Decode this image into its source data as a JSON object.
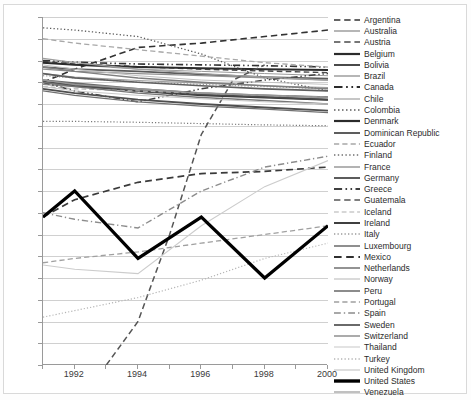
{
  "chart_data": {
    "type": "line",
    "title": "",
    "xlabel": "",
    "ylabel": "",
    "xlim": [
      1991,
      2000
    ],
    "ylim": [
      15,
      95
    ],
    "ytick_labels": [
      "95",
      "90",
      "85",
      "80",
      "75",
      "70",
      "65",
      "60",
      "55",
      "50",
      "45",
      "40",
      "35",
      "30",
      "25",
      "20",
      "15"
    ],
    "ytick_values": [
      95,
      90,
      85,
      80,
      75,
      70,
      65,
      60,
      55,
      50,
      45,
      40,
      35,
      30,
      25,
      20,
      15
    ],
    "xtick_labels": [
      "1992",
      "1994",
      "1996",
      "1998",
      "2000"
    ],
    "xtick_values": [
      1992,
      1994,
      1996,
      1998,
      2000
    ],
    "xminor_values": [
      1991,
      1993,
      1995,
      1997,
      1999
    ],
    "grid": "horizontal",
    "legend_position": "right",
    "x": [
      1991,
      1992,
      1993,
      1994,
      1995,
      1996,
      1997,
      1998,
      1999,
      2000
    ],
    "series": [
      {
        "name": "Argentina",
        "style": "dashed",
        "width": 1.6,
        "color": "#333333",
        "x": [
          1991,
          1992,
          1994,
          1996,
          1998,
          2000
        ],
        "values": [
          80.0,
          83.0,
          88.0,
          89.0,
          90.5,
          92.0
        ]
      },
      {
        "name": "Australia",
        "style": "solid",
        "width": 1.0,
        "color": "#9a9a9a",
        "x": [
          1991,
          1992,
          1994,
          1996,
          1998,
          2000
        ],
        "values": [
          84.5,
          84.0,
          83.0,
          82.5,
          82.0,
          81.5
        ]
      },
      {
        "name": "Austria",
        "style": "dashed",
        "width": 1.4,
        "color": "#4a4a4a",
        "x": [
          1991,
          1992,
          1994,
          1996,
          1998,
          2000
        ],
        "values": [
          84.8,
          84.2,
          83.6,
          83.0,
          82.6,
          82.2
        ]
      },
      {
        "name": "Belgium",
        "style": "solid",
        "width": 2.0,
        "color": "#2b2b2b",
        "x": [
          1991,
          1992,
          1994,
          1996,
          1998,
          2000
        ],
        "values": [
          84.5,
          84.0,
          83.5,
          83.2,
          83.0,
          82.8
        ]
      },
      {
        "name": "Bolivia",
        "style": "solid",
        "width": 1.8,
        "color": "#5a5a5a",
        "x": [
          1991,
          1992,
          1994,
          1996,
          1998,
          2000
        ],
        "values": [
          83.5,
          83.0,
          82.5,
          81.8,
          81.2,
          80.8
        ]
      },
      {
        "name": "Brazil",
        "style": "solid",
        "width": 1.2,
        "color": "#8f8f8f",
        "x": [
          1991,
          1992,
          1994,
          1996,
          1998,
          2000
        ],
        "values": [
          83.0,
          82.5,
          82.0,
          81.5,
          81.0,
          80.5
        ]
      },
      {
        "name": "Canada",
        "style": "dashdotdot",
        "width": 1.6,
        "color": "#333333",
        "x": [
          1991,
          1992,
          1994,
          1996,
          1998,
          2000
        ],
        "values": [
          85.0,
          84.6,
          84.2,
          84.0,
          83.8,
          83.5
        ]
      },
      {
        "name": "Chile",
        "style": "solid",
        "width": 1.1,
        "color": "#9f9f9f",
        "x": [
          1991,
          1992,
          1994,
          1996,
          1998,
          2000
        ],
        "values": [
          82.0,
          81.2,
          80.4,
          79.8,
          79.2,
          78.8
        ]
      },
      {
        "name": "Colombia",
        "style": "dotted",
        "width": 1.3,
        "color": "#5c5c5c",
        "x": [
          1991,
          1992,
          1994,
          1996,
          1998,
          2000
        ],
        "values": [
          92.5,
          92.0,
          90.5,
          86.5,
          81.0,
          78.0
        ]
      },
      {
        "name": "Denmark",
        "style": "solid",
        "width": 2.0,
        "color": "#3a3a3a",
        "x": [
          1991,
          1992,
          1994,
          1996,
          1998,
          2000
        ],
        "values": [
          80.0,
          79.5,
          78.0,
          77.0,
          76.5,
          76.0
        ]
      },
      {
        "name": "Dominican Republic",
        "style": "solid",
        "width": 1.8,
        "color": "#6a6a6a",
        "x": [
          1991,
          1992,
          1994,
          1996,
          1998,
          2000
        ],
        "values": [
          80.5,
          79.8,
          78.5,
          77.5,
          77.0,
          76.6
        ]
      },
      {
        "name": "Ecuador",
        "style": "dashed",
        "width": 1.3,
        "color": "#a8a8a8",
        "x": [
          1991,
          1992,
          1994,
          1996,
          1998,
          2000
        ],
        "values": [
          90.0,
          89.0,
          87.5,
          86.0,
          84.5,
          83.5
        ]
      },
      {
        "name": "Finland",
        "style": "dotted",
        "width": 1.2,
        "color": "#7a7a7a",
        "x": [
          1991,
          1992,
          1994,
          1996,
          1998,
          2000
        ],
        "values": [
          71.0,
          71.0,
          70.8,
          70.5,
          70.2,
          70.0
        ]
      },
      {
        "name": "France",
        "style": "solid",
        "width": 1.2,
        "color": "#8a8a8a",
        "x": [
          1991,
          1992,
          1994,
          1996,
          1998,
          2000
        ],
        "values": [
          79.5,
          79.0,
          78.2,
          77.5,
          77.0,
          76.5
        ]
      },
      {
        "name": "Germany",
        "style": "solid",
        "width": 1.6,
        "color": "#4a4a4a",
        "x": [
          1991,
          1992,
          1994,
          1996,
          1998,
          2000
        ],
        "values": [
          80.0,
          79.2,
          78.0,
          77.2,
          76.6,
          76.0
        ]
      },
      {
        "name": "Greece",
        "style": "dashdotdot",
        "width": 1.5,
        "color": "#3f3f3f",
        "x": [
          1991,
          1992,
          1994,
          1996,
          1998,
          2000
        ],
        "values": [
          80.0,
          78.0,
          75.5,
          78.5,
          80.5,
          82.0
        ]
      },
      {
        "name": "Guatemala",
        "style": "dashed",
        "width": 1.5,
        "color": "#555555",
        "x": [
          1993,
          1994,
          1995,
          1996,
          1997,
          1998
        ],
        "values": [
          15.0,
          25.0,
          45.0,
          68.0,
          80.5,
          84.0
        ]
      },
      {
        "name": "Iceland",
        "style": "dashed",
        "width": 1.2,
        "color": "#b0b0b0",
        "x": [
          1991,
          1992,
          1994,
          1996,
          1998,
          2000
        ],
        "values": [
          79.0,
          78.5,
          78.0,
          77.5,
          77.0,
          76.5
        ]
      },
      {
        "name": "Ireland",
        "style": "solid",
        "width": 1.8,
        "color": "#4f4f4f",
        "x": [
          1991,
          1992,
          1994,
          1996,
          1998,
          2000
        ],
        "values": [
          78.5,
          77.5,
          76.0,
          75.0,
          74.2,
          73.5
        ]
      },
      {
        "name": "Italy",
        "style": "dotted",
        "width": 1.2,
        "color": "#9a9a9a",
        "x": [
          1991,
          1992,
          1994,
          1996,
          1998,
          2000
        ],
        "values": [
          81.5,
          81.0,
          80.0,
          79.5,
          79.0,
          78.5
        ]
      },
      {
        "name": "Luxembourg",
        "style": "solid",
        "width": 1.3,
        "color": "#707070",
        "x": [
          1991,
          1992,
          1994,
          1996,
          1998,
          2000
        ],
        "values": [
          78.0,
          77.0,
          75.5,
          74.5,
          73.8,
          73.0
        ]
      },
      {
        "name": "Mexico",
        "style": "dashed",
        "width": 1.7,
        "color": "#3a3a3a",
        "x": [
          1991,
          1992,
          1994,
          1996,
          1998,
          2000
        ],
        "values": [
          49.0,
          53.0,
          57.0,
          59.0,
          59.5,
          60.5
        ]
      },
      {
        "name": "Netherlands",
        "style": "solid",
        "width": 1.4,
        "color": "#757575",
        "x": [
          1991,
          1992,
          1994,
          1996,
          1998,
          2000
        ],
        "values": [
          80.0,
          79.0,
          77.5,
          76.5,
          75.8,
          75.0
        ]
      },
      {
        "name": "Norway",
        "style": "solid",
        "width": 1.0,
        "color": "#c0c0c0",
        "x": [
          1991,
          1992,
          1994,
          1996,
          1998,
          2000
        ],
        "values": [
          84.0,
          83.0,
          81.5,
          80.5,
          80.0,
          79.5
        ]
      },
      {
        "name": "Peru",
        "style": "solid",
        "width": 1.5,
        "color": "#7f7f7f",
        "x": [
          1991,
          1992,
          1994,
          1996,
          1998,
          2000
        ],
        "values": [
          83.5,
          82.5,
          81.0,
          80.0,
          79.2,
          78.5
        ]
      },
      {
        "name": "Portugal",
        "style": "dashed",
        "width": 1.3,
        "color": "#a0a0a0",
        "x": [
          1991,
          1992,
          1994,
          1996,
          1998,
          2000
        ],
        "values": [
          38.5,
          39.5,
          41.0,
          43.0,
          45.0,
          47.0
        ]
      },
      {
        "name": "Spain",
        "style": "dashdot",
        "width": 1.4,
        "color": "#8c8c8c",
        "x": [
          1991,
          1992,
          1994,
          1996,
          1998,
          2000
        ],
        "values": [
          50.0,
          48.5,
          46.5,
          55.0,
          60.5,
          63.0
        ]
      },
      {
        "name": "Sweden",
        "style": "solid",
        "width": 1.7,
        "color": "#5f5f5f",
        "x": [
          1991,
          1992,
          1994,
          1996,
          1998,
          2000
        ],
        "values": [
          82.0,
          81.0,
          80.0,
          79.2,
          78.5,
          78.0
        ]
      },
      {
        "name": "Switzerland",
        "style": "solid",
        "width": 1.5,
        "color": "#959595",
        "x": [
          1991,
          1992,
          1994,
          1996,
          1998,
          2000
        ],
        "values": [
          80.5,
          79.5,
          78.5,
          77.5,
          77.0,
          76.5
        ]
      },
      {
        "name": "Thailand",
        "style": "solid",
        "width": 1.1,
        "color": "#cccccc",
        "x": [
          1991,
          1992,
          1994,
          1996,
          1998,
          2000
        ],
        "values": [
          38.0,
          37.0,
          36.0,
          47.0,
          56.0,
          62.0
        ]
      },
      {
        "name": "Turkey",
        "style": "dotted",
        "width": 1.2,
        "color": "#b5b5b5",
        "x": [
          1991,
          1992,
          1994,
          1996,
          1998,
          2000
        ],
        "values": [
          26.0,
          27.5,
          30.5,
          34.5,
          39.5,
          43.0
        ]
      },
      {
        "name": "United Kingdom",
        "style": "solid",
        "width": 1.0,
        "color": "#c8c8c8",
        "x": [
          1991,
          1992,
          1994,
          1996,
          1998,
          2000
        ],
        "values": [
          79.0,
          78.0,
          77.0,
          76.2,
          75.5,
          75.0
        ]
      },
      {
        "name": "United States",
        "style": "solid",
        "width": 3.2,
        "color": "#000000",
        "x": [
          1991,
          1992,
          1994,
          1996,
          1998,
          2000
        ],
        "values": [
          49.0,
          55.0,
          39.5,
          49.0,
          35.0,
          47.0
        ]
      },
      {
        "name": "Venezuela",
        "style": "solid",
        "width": 1.2,
        "color": "#9e9e9e",
        "x": [
          1991,
          1992,
          1994,
          1996,
          1998,
          2000
        ],
        "values": [
          85.5,
          84.5,
          83.0,
          82.0,
          81.2,
          80.5
        ]
      }
    ],
    "legend_entries": [
      {
        "label": "Argentina",
        "style": "dashed",
        "width": 1.6,
        "color": "#333333"
      },
      {
        "label": "Australia",
        "style": "solid",
        "width": 1.3,
        "color": "#8f8f8f"
      },
      {
        "label": "Austria",
        "style": "dashed",
        "width": 1.6,
        "color": "#4a4a4a"
      },
      {
        "label": "Belgium",
        "style": "solid",
        "width": 2.2,
        "color": "#2b2b2b"
      },
      {
        "label": "Bolivia",
        "style": "solid",
        "width": 2.0,
        "color": "#4a4a4a"
      },
      {
        "label": "Brazil",
        "style": "solid",
        "width": 1.3,
        "color": "#8f8f8f"
      },
      {
        "label": "Canada",
        "style": "dashdotdot",
        "width": 1.9,
        "color": "#2b2b2b"
      },
      {
        "label": "Chile",
        "style": "solid",
        "width": 1.2,
        "color": "#9f9f9f"
      },
      {
        "label": "Colombia",
        "style": "dotted",
        "width": 1.5,
        "color": "#5c5c5c"
      },
      {
        "label": "Denmark",
        "style": "solid",
        "width": 2.2,
        "color": "#2b2b2b"
      },
      {
        "label": "Dominican Republic",
        "style": "solid",
        "width": 1.9,
        "color": "#555555"
      },
      {
        "label": "Ecuador",
        "style": "dashed",
        "width": 1.3,
        "color": "#a8a8a8"
      },
      {
        "label": "Finland",
        "style": "dotted",
        "width": 1.4,
        "color": "#6f6f6f"
      },
      {
        "label": "France",
        "style": "solid",
        "width": 1.3,
        "color": "#8a8a8a"
      },
      {
        "label": "Germany",
        "style": "solid",
        "width": 1.8,
        "color": "#4a4a4a"
      },
      {
        "label": "Greece",
        "style": "dashdotdot",
        "width": 1.8,
        "color": "#3f3f3f"
      },
      {
        "label": "Guatemala",
        "style": "dashed",
        "width": 1.6,
        "color": "#555555"
      },
      {
        "label": "Iceland",
        "style": "dashed",
        "width": 1.2,
        "color": "#b0b0b0"
      },
      {
        "label": "Ireland",
        "style": "solid",
        "width": 2.0,
        "color": "#3f3f3f"
      },
      {
        "label": "Italy",
        "style": "dotted",
        "width": 1.3,
        "color": "#9a9a9a"
      },
      {
        "label": "Luxembourg",
        "style": "solid",
        "width": 1.5,
        "color": "#6a6a6a"
      },
      {
        "label": "Mexico",
        "style": "dashed",
        "width": 1.9,
        "color": "#2f2f2f"
      },
      {
        "label": "Netherlands",
        "style": "solid",
        "width": 1.5,
        "color": "#6f6f6f"
      },
      {
        "label": "Norway",
        "style": "solid",
        "width": 1.1,
        "color": "#bcbcbc"
      },
      {
        "label": "Peru",
        "style": "solid",
        "width": 1.6,
        "color": "#6f6f6f"
      },
      {
        "label": "Portugal",
        "style": "dashed",
        "width": 1.3,
        "color": "#a0a0a0"
      },
      {
        "label": "Spain",
        "style": "dashdot",
        "width": 1.5,
        "color": "#8c8c8c"
      },
      {
        "label": "Sweden",
        "style": "solid",
        "width": 1.8,
        "color": "#5a5a5a"
      },
      {
        "label": "Switzerland",
        "style": "solid",
        "width": 1.5,
        "color": "#8f8f8f"
      },
      {
        "label": "Thailand",
        "style": "solid",
        "width": 1.1,
        "color": "#cccccc"
      },
      {
        "label": "Turkey",
        "style": "dotted",
        "width": 1.3,
        "color": "#b5b5b5"
      },
      {
        "label": "United Kingdom",
        "style": "solid",
        "width": 1.1,
        "color": "#c4c4c4"
      },
      {
        "label": "United States",
        "style": "solid",
        "width": 3.4,
        "color": "#000000"
      },
      {
        "label": "Venezuela",
        "style": "solid",
        "width": 1.3,
        "color": "#9e9e9e"
      }
    ]
  }
}
